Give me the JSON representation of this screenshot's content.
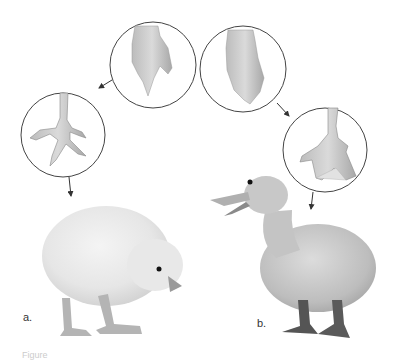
{
  "figure": {
    "panels": [
      {
        "id": "a",
        "label": "a.",
        "animal": "chick",
        "embryo_foot": "chick-embryo-foot",
        "adult_foot": "chick-foot"
      },
      {
        "id": "b",
        "label": "b.",
        "animal": "duckling",
        "embryo_foot": "duck-embryo-foot",
        "adult_foot": "duck-webbed-foot"
      }
    ],
    "caption": "Figure"
  }
}
